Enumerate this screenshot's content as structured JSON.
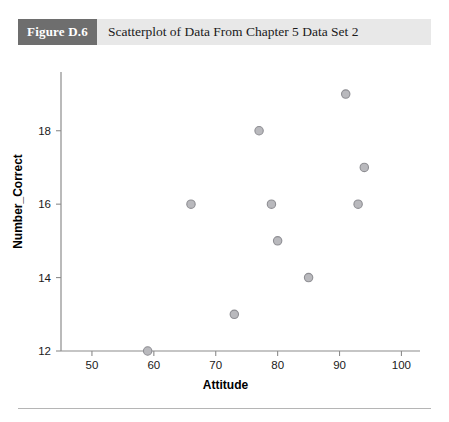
{
  "figure": {
    "number_label": "Figure D.6",
    "caption": "Scatterplot of Data From Chapter 5 Data Set 2",
    "badge_color": "#6e6e6e",
    "band_color": "#e8e8e8"
  },
  "chart_data": {
    "type": "scatter",
    "title": "Scatterplot of Data From Chapter 5 Data Set 2",
    "xlabel": "Attitude",
    "ylabel": "Number_Correct",
    "xlim": [
      45,
      103
    ],
    "ylim": [
      12,
      19.6
    ],
    "xticks": [
      50,
      60,
      70,
      80,
      90,
      100
    ],
    "xtick_labels": [
      "50",
      "60",
      "70",
      "80",
      "90",
      "100"
    ],
    "yticks": [
      12,
      14,
      16,
      18
    ],
    "ytick_labels": [
      "12",
      "14",
      "16",
      "18"
    ],
    "grid": false,
    "legend": false,
    "marker": {
      "shape": "circle",
      "fill_color": "#b9b9bd",
      "edge_color": "#8e8e93",
      "radius": 4.2
    },
    "points": [
      {
        "x": 59,
        "y": 12
      },
      {
        "x": 66,
        "y": 16
      },
      {
        "x": 73,
        "y": 13
      },
      {
        "x": 77,
        "y": 18
      },
      {
        "x": 79,
        "y": 16
      },
      {
        "x": 80,
        "y": 15
      },
      {
        "x": 85,
        "y": 14
      },
      {
        "x": 91,
        "y": 19
      },
      {
        "x": 93,
        "y": 16
      },
      {
        "x": 94,
        "y": 17
      }
    ]
  }
}
